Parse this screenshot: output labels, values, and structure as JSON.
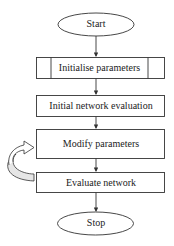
{
  "diagram": {
    "type": "flowchart",
    "nodes": [
      {
        "id": "start",
        "shape": "ellipse",
        "label": "Start"
      },
      {
        "id": "init",
        "shape": "predefined-process",
        "label": "Initialise parameters"
      },
      {
        "id": "initial_eval",
        "shape": "rectangle",
        "label": "Initial network evaluation"
      },
      {
        "id": "modify",
        "shape": "rectangle",
        "label": "Modify parameters"
      },
      {
        "id": "evaluate",
        "shape": "rectangle",
        "label": "Evaluate network"
      },
      {
        "id": "stop",
        "shape": "ellipse",
        "label": "Stop"
      }
    ],
    "edges": [
      {
        "from": "start",
        "to": "init"
      },
      {
        "from": "init",
        "to": "initial_eval"
      },
      {
        "from": "initial_eval",
        "to": "modify"
      },
      {
        "from": "modify",
        "to": "evaluate"
      },
      {
        "from": "evaluate",
        "to": "modify",
        "style": "curved-loop-arrow"
      },
      {
        "from": "evaluate",
        "to": "stop"
      }
    ],
    "colors": {
      "stroke": "#333333",
      "fill": "#ffffff",
      "loop_fill": "#e6e6e6"
    }
  }
}
